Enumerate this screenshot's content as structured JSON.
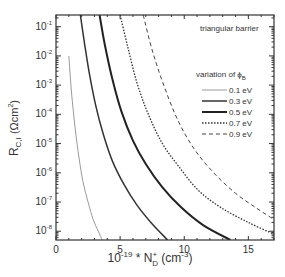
{
  "chart_data": {
    "type": "line",
    "title": "",
    "xlabel": "10^-19 * N_D^+ (cm^-3)",
    "xlabel_parts": {
      "base": "10",
      "exp": "-19",
      "mid": " * N",
      "sub": "D",
      "sup": "+",
      "unit": " (cm",
      "unit_exp": "-3",
      "close": ")"
    },
    "ylabel": "R_C,I (Ωcm²)",
    "ylabel_parts": {
      "main": "R",
      "sub": "C,I",
      "unit": " (Ωcm",
      "unit_exp": "2",
      "close": ")"
    },
    "xlim": [
      0,
      17
    ],
    "ylim_log10": [
      -8.3,
      -0.6
    ],
    "x_ticks": [
      0,
      5,
      10,
      15
    ],
    "y_ticks_log10": [
      -1,
      -2,
      -3,
      -4,
      -5,
      -6,
      -7,
      -8
    ],
    "y_tick_labels": [
      "10-1",
      "10-2",
      "10-3",
      "10-4",
      "10-5",
      "10-6",
      "10-7",
      "10-8"
    ],
    "grid": false,
    "annotations": [
      {
        "text": "triangular barrier"
      }
    ],
    "legend": {
      "title": "variation of ϕB",
      "title_main": "variation of ϕ",
      "title_sub": "B",
      "position": "upper right"
    },
    "series": [
      {
        "name": "0.1 eV",
        "style": "solid-thin",
        "color": "#9a9a9a",
        "x": [
          1.0,
          1.2,
          1.5,
          1.8,
          2.1,
          2.5,
          2.9,
          3.3,
          3.6
        ],
        "log10y": [
          -2.0,
          -3.2,
          -4.5,
          -5.5,
          -6.3,
          -7.0,
          -7.6,
          -8.0,
          -8.3
        ]
      },
      {
        "name": "0.3 eV",
        "style": "solid",
        "color": "#333333",
        "x": [
          1.9,
          2.2,
          2.6,
          3.1,
          3.7,
          4.4,
          5.3,
          6.3,
          7.4,
          8.7
        ],
        "log10y": [
          -0.6,
          -1.5,
          -2.6,
          -3.7,
          -4.7,
          -5.6,
          -6.4,
          -7.1,
          -7.7,
          -8.3
        ]
      },
      {
        "name": "0.5 eV",
        "style": "solid-thick",
        "color": "#222222",
        "x": [
          3.4,
          3.8,
          4.4,
          5.1,
          6.0,
          7.0,
          8.3,
          9.8,
          11.5,
          13.6
        ],
        "log10y": [
          -0.6,
          -1.6,
          -2.8,
          -3.9,
          -4.9,
          -5.7,
          -6.5,
          -7.2,
          -7.8,
          -8.3
        ]
      },
      {
        "name": "0.7 eV",
        "style": "dotted",
        "color": "#333333",
        "x": [
          5.0,
          5.6,
          6.3,
          7.2,
          8.3,
          9.6,
          11.1,
          12.9,
          15.0,
          17.0
        ],
        "log10y": [
          -0.6,
          -1.7,
          -2.9,
          -4.0,
          -5.0,
          -5.8,
          -6.6,
          -7.2,
          -7.7,
          -8.1
        ]
      },
      {
        "name": "0.9 eV",
        "style": "dashed",
        "color": "#444444",
        "x": [
          6.8,
          7.5,
          8.4,
          9.5,
          10.8,
          12.3,
          14.0,
          15.6,
          17.0
        ],
        "log10y": [
          -0.6,
          -1.8,
          -3.0,
          -4.2,
          -5.2,
          -6.0,
          -6.7,
          -7.2,
          -7.6
        ]
      }
    ]
  }
}
